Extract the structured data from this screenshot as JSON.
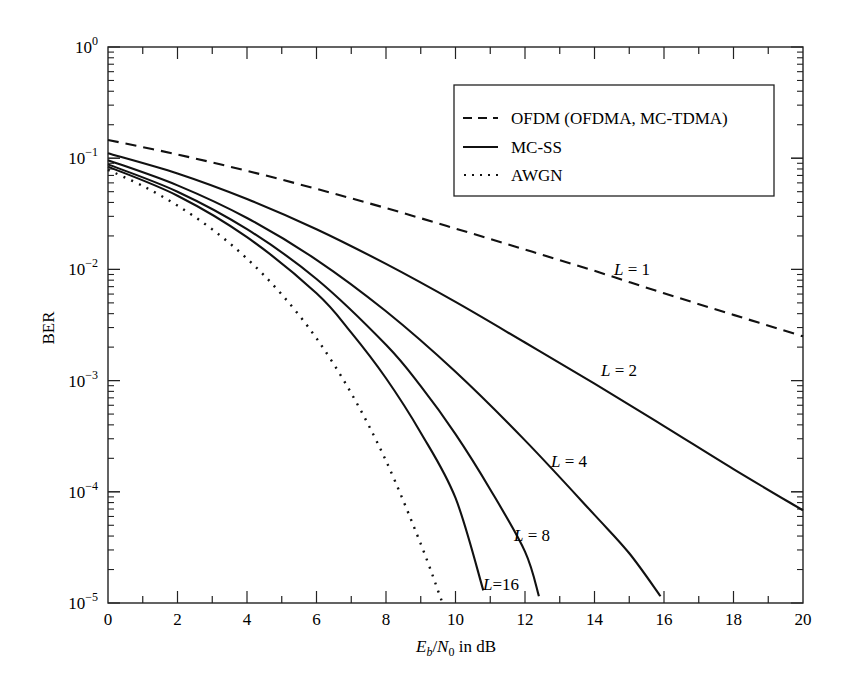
{
  "chart_data": {
    "type": "line",
    "title": "",
    "xlabel": "E_b/N_0 in dB",
    "xlabel_parts": {
      "E": "E",
      "b": "b",
      "slash": "/",
      "N": "N",
      "zero": "0",
      "rest": " in dB"
    },
    "ylabel": "BER",
    "xlim": [
      0,
      20
    ],
    "ylim": [
      1e-05,
      1
    ],
    "yscale": "log",
    "grid": false,
    "x_ticks": [
      0,
      2,
      4,
      6,
      8,
      10,
      12,
      14,
      16,
      18,
      20
    ],
    "x_tick_labels": [
      "0",
      "2",
      "4",
      "6",
      "8",
      "10",
      "12",
      "14",
      "16",
      "18",
      "20"
    ],
    "y_tick_labels": [
      {
        "base": "10",
        "exp": "0",
        "value": 1
      },
      {
        "base": "10",
        "exp": "−1",
        "value": 0.1
      },
      {
        "base": "10",
        "exp": "−2",
        "value": 0.01
      },
      {
        "base": "10",
        "exp": "−3",
        "value": 0.001
      },
      {
        "base": "10",
        "exp": "−4",
        "value": 0.0001
      },
      {
        "base": "10",
        "exp": "−5",
        "value": 1e-05
      }
    ],
    "legend": {
      "position": "upper right",
      "entries": [
        {
          "label": "OFDM (OFDMA, MC-TDMA)",
          "style": "dashed"
        },
        {
          "label": "MC-SS",
          "style": "solid"
        },
        {
          "label": "AWGN",
          "style": "dotted"
        }
      ]
    },
    "series": [
      {
        "name": "OFDM L = 1",
        "style": "dashed",
        "x": [
          0,
          2,
          4,
          6,
          8,
          10,
          12,
          14,
          16,
          18,
          20
        ],
        "y": [
          0.146,
          0.108,
          0.077,
          0.053,
          0.0356,
          0.0233,
          0.0151,
          0.0097,
          0.0061,
          0.0039,
          0.0025
        ]
      },
      {
        "name": "MC-SS L = 2",
        "style": "solid",
        "x": [
          0,
          2,
          4,
          6,
          8,
          10,
          12,
          14,
          16,
          18,
          20
        ],
        "y": [
          0.111,
          0.073,
          0.043,
          0.023,
          0.0112,
          0.0051,
          0.0022,
          0.00094,
          0.00039,
          0.00016,
          6.8e-05
        ]
      },
      {
        "name": "MC-SS L = 4",
        "style": "solid",
        "x": [
          0,
          2,
          4,
          6,
          8,
          10,
          12,
          14,
          15,
          15.9
        ],
        "y": [
          0.096,
          0.057,
          0.029,
          0.0122,
          0.0042,
          0.0012,
          0.00029,
          6.2e-05,
          2.8e-05,
          1.15e-05
        ]
      },
      {
        "name": "MC-SS L = 8",
        "style": "solid",
        "x": [
          0,
          2,
          4,
          6,
          8,
          9,
          10,
          11,
          12,
          12.4
        ],
        "y": [
          0.088,
          0.05,
          0.023,
          0.0082,
          0.0021,
          0.00089,
          0.00033,
          0.000105,
          2.9e-05,
          1.15e-05
        ]
      },
      {
        "name": "MC-SS L = 16",
        "style": "solid",
        "x": [
          0,
          2,
          4,
          6,
          7,
          8,
          9,
          10,
          10.8
        ],
        "y": [
          0.084,
          0.046,
          0.0195,
          0.0061,
          0.0027,
          0.00105,
          0.00034,
          8.8e-05,
          1.3e-05
        ]
      },
      {
        "name": "AWGN",
        "style": "dotted",
        "x": [
          0,
          1,
          2,
          3,
          4,
          5,
          6,
          7,
          8,
          9,
          9.6
        ],
        "y": [
          0.0786,
          0.0563,
          0.0375,
          0.0229,
          0.0125,
          0.00595,
          0.0024,
          0.00077,
          0.00019,
          3.4e-05,
          1.05e-05
        ]
      }
    ],
    "annotations": [
      {
        "text": "L = 1",
        "italic_part": "L",
        "rest": " = 1",
        "x_px": 614,
        "y_px": 275
      },
      {
        "text": "L = 2",
        "italic_part": "L",
        "rest": " = 2",
        "x_px": 601,
        "y_px": 376
      },
      {
        "text": "L = 4",
        "italic_part": "L",
        "rest": " = 4",
        "x_px": 551,
        "y_px": 467
      },
      {
        "text": "L = 8",
        "italic_part": "L",
        "rest": " = 8",
        "x_px": 514,
        "y_px": 541
      },
      {
        "text": "L=16",
        "italic_part": "L",
        "rest": "=16",
        "x_px": 483,
        "y_px": 590
      }
    ]
  }
}
